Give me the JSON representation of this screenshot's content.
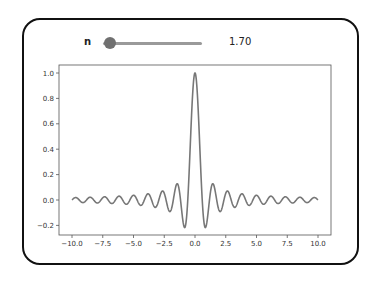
{
  "widget": {
    "slider_label": "n",
    "slider_value": "1.70",
    "slider_min": 0,
    "slider_max": 10
  },
  "chart_data": {
    "type": "line",
    "title": "",
    "xlabel": "",
    "ylabel": "",
    "function": "sin(pi*n*x)/(pi*n*x)",
    "n": 1.7,
    "xlim": [
      -10.0,
      10.0
    ],
    "ylim": [
      -0.25,
      1.05
    ],
    "x_ticks": [
      "-10.0",
      "-7.5",
      "-5.0",
      "-2.5",
      "0.0",
      "2.5",
      "5.0",
      "7.5",
      "10.0"
    ],
    "y_ticks": [
      "-0.2",
      "0.0",
      "0.2",
      "0.4",
      "0.6",
      "0.8",
      "1.0"
    ],
    "grid": false,
    "legend": null,
    "line_color": "#777777",
    "series": [
      {
        "name": "sinc",
        "peak": 1.0,
        "first_minimum": -0.217
      }
    ]
  }
}
